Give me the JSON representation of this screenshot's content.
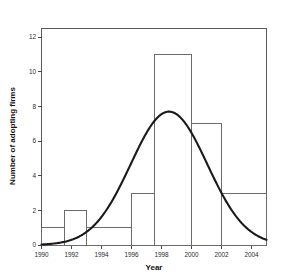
{
  "chart_data": {
    "type": "bar",
    "title": "",
    "subtitle": "",
    "xlabel": "Year",
    "ylabel": "Number of adopting firms",
    "xlim": [
      1990,
      2005
    ],
    "ylim": [
      0,
      12.5
    ],
    "grid": false,
    "legend": null,
    "xticks": [
      "1990",
      "1992",
      "1994",
      "1996",
      "1998",
      "2000",
      "2002",
      "2004"
    ],
    "xtick_values": [
      1990,
      1992,
      1994,
      1996,
      1998,
      2000,
      2002,
      2004
    ],
    "yticks": [
      "0",
      "2",
      "4",
      "6",
      "8",
      "10",
      "12"
    ],
    "ytick_values": [
      0,
      2,
      4,
      6,
      8,
      10,
      12
    ],
    "bin_width": 1.5,
    "bins": [
      {
        "start": 1990.0,
        "end": 1991.5,
        "label": "1990.0-1991.5",
        "value": 1
      },
      {
        "start": 1991.5,
        "end": 1993.0,
        "label": "1991.5-1993.0",
        "value": 2
      },
      {
        "start": 1993.0,
        "end": 1996.0,
        "label": "1993.0-1996.0",
        "value": 1
      },
      {
        "start": 1996.0,
        "end": 1997.5,
        "label": "1996.0-1997.5",
        "value": 3
      },
      {
        "start": 1997.5,
        "end": 2000.0,
        "label": "1997.5-2000.0",
        "value": 11
      },
      {
        "start": 2000.0,
        "end": 2002.0,
        "label": "2000.0-2002.0",
        "value": 7
      },
      {
        "start": 2002.0,
        "end": 2005.0,
        "label": "2002.0-2005.0",
        "value": 3
      }
    ],
    "categories": [
      "1990.0-1991.5",
      "1991.5-1993.0",
      "1993.0-1996.0",
      "1996.0-1997.5",
      "1997.5-2000.0",
      "2000.0-2002.0",
      "2002.0-2005.0"
    ],
    "values": [
      1,
      2,
      1,
      3,
      11,
      7,
      3
    ],
    "overlay_curve": {
      "name": "normal-fit",
      "type": "line",
      "peak_x": 1998.5,
      "peak_y": 7.7,
      "sigma": 2.55,
      "x_start": 1990.0,
      "x_end": 2005.0,
      "y_at_x_start": 0.15,
      "y_at_x_end": 0.65
    },
    "colors": {
      "bar_stroke": "#6b6b6b",
      "bar_fill": "none",
      "curve": "#1a1a1a",
      "frame": "#5a5a5a",
      "text": "#111111",
      "background": "#ffffff"
    }
  }
}
